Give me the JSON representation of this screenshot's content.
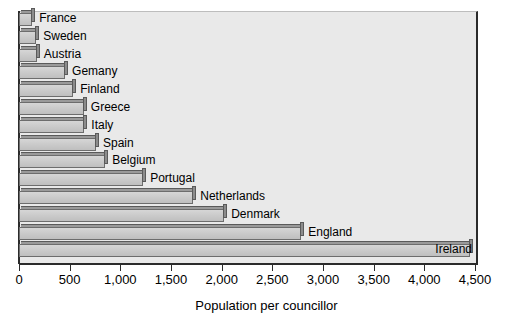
{
  "chart_data": {
    "type": "bar",
    "orientation": "horizontal",
    "title": "",
    "xlabel": "Population per councillor",
    "ylabel": "",
    "xlim": [
      0,
      4500
    ],
    "xticks": [
      0,
      500,
      1000,
      1500,
      2000,
      2500,
      3000,
      3500,
      4000,
      4500
    ],
    "xtick_labels": [
      "0",
      "500",
      "1,000",
      "1,500",
      "2,000",
      "2,500",
      "3,000",
      "3,500",
      "4,000",
      "4,500"
    ],
    "grid": false,
    "legend": "none",
    "categories": [
      "France",
      "Sweden",
      "Austria",
      "Gemany",
      "Finland",
      "Greece",
      "Italy",
      "Spain",
      "Belgium",
      "Portugal",
      "Netherlands",
      "Denmark",
      "England",
      "Ireland"
    ],
    "values": [
      130,
      170,
      175,
      455,
      535,
      640,
      645,
      760,
      850,
      1225,
      1720,
      2025,
      2785,
      4450
    ],
    "bar_color": "#cccccc",
    "bar_edge_color": "#6d6d6d",
    "plot_background": "#e9e9e9",
    "axis_color": "#2b2b2b",
    "label_placement": "outside-end, except last bar which is inside-end"
  },
  "axis": {
    "x_title": "Population per councillor"
  }
}
